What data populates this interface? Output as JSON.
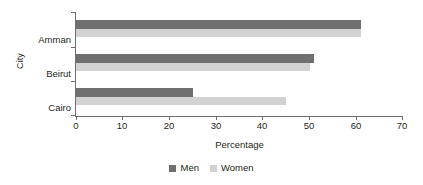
{
  "chart_data": {
    "type": "bar",
    "orientation": "horizontal",
    "title": "",
    "categories": [
      "Amman",
      "Beirut",
      "Cairo"
    ],
    "series": [
      {
        "name": "Men",
        "values": [
          61,
          51,
          25
        ],
        "color": "#6f6f6f"
      },
      {
        "name": "Women",
        "values": [
          61,
          50,
          45
        ],
        "color": "#d2d2d2"
      }
    ],
    "xlabel": "Percentage",
    "ylabel": "City",
    "xlim": [
      0,
      70
    ],
    "xticks": [
      0,
      10,
      20,
      30,
      40,
      50,
      60,
      70
    ],
    "xtick_labels": [
      "0",
      "10",
      "20",
      "30",
      "40",
      "50",
      "60",
      "70"
    ],
    "grid": false,
    "legend": {
      "position": "bottom",
      "entries": [
        {
          "label": "Men",
          "color": "#6f6f6f"
        },
        {
          "label": "Women",
          "color": "#d2d2d2"
        }
      ]
    },
    "axis_color": "#6d6e71",
    "text_color": "#231f20",
    "background": "#ffffff"
  }
}
